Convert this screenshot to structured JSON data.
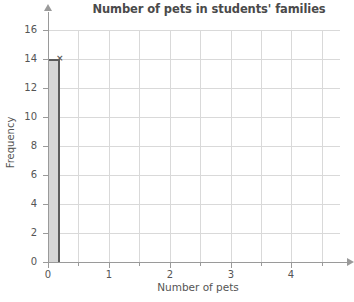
{
  "chart_data": {
    "type": "bar",
    "title": "Number of pets in students' families",
    "xlabel": "Number of pets",
    "ylabel": "Frequency",
    "categories": [
      "0"
    ],
    "values": [
      14
    ],
    "xlim": [
      0,
      4.8
    ],
    "ylim": [
      0,
      16
    ],
    "x_ticks": [
      "0",
      "1",
      "2",
      "3",
      "4"
    ],
    "x_tick_values": [
      0,
      1,
      2,
      3,
      4
    ],
    "x_minor_tick_values": [
      0.5,
      1.5,
      2.5,
      3.5,
      4.5
    ],
    "y_ticks": [
      "0",
      "2",
      "4",
      "6",
      "8",
      "10",
      "12",
      "14",
      "16"
    ],
    "y_tick_values": [
      0,
      2,
      4,
      6,
      8,
      10,
      12,
      14,
      16
    ],
    "grid": "both",
    "grid_h_values": [
      2,
      4,
      6,
      8,
      10,
      12,
      14,
      16
    ],
    "grid_v_values": [
      0.5,
      1,
      1.5,
      2,
      2.5,
      3,
      3.5,
      4,
      4.5
    ],
    "legend": "none",
    "bar_left_value": 0,
    "bar_right_value": 0.2,
    "bar_fill_color": "#d6d6d6",
    "bar_edge_color": "#5c5c5c",
    "grid_color": "#d9d9d9",
    "axis_color": "#9a9a9a",
    "text_color": "#555555",
    "title_color": "#4a4a4a",
    "handle_marker": "×"
  }
}
